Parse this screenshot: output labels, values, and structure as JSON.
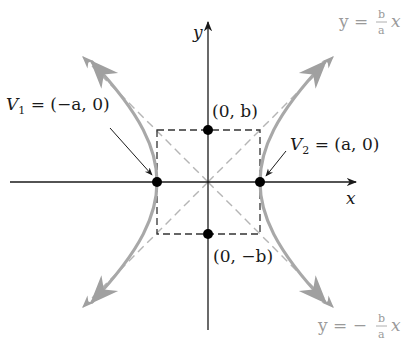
{
  "diagram": {
    "axes": {
      "x_label": "x",
      "y_label": "y"
    },
    "vertices": [
      {
        "name": "V1",
        "label_main": "V",
        "label_sub": "1",
        "label_rest": " = (−a, 0)",
        "coords": "(−a, 0)"
      },
      {
        "name": "V2",
        "label_main": "V",
        "label_sub": "2",
        "label_rest": " = (a, 0)",
        "coords": "(a, 0)"
      }
    ],
    "covertex_points": [
      {
        "label": "(0, b)"
      },
      {
        "label": "(0, −b)"
      }
    ],
    "asymptotes": [
      {
        "lhs": "y = ",
        "num": "b",
        "den": "a",
        "rhs": "x",
        "sign": ""
      },
      {
        "lhs": "y = −",
        "num": "b",
        "den": "a",
        "rhs": "x",
        "sign": "−"
      }
    ],
    "colors": {
      "axes": "#1a1a1a",
      "hyperbola": "#a8a8a8",
      "asymptote": "#b0b0b0",
      "box": "#333333",
      "points": "#000000"
    }
  }
}
